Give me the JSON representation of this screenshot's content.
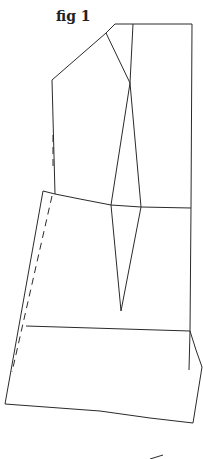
{
  "figure": {
    "caption": "fig 1",
    "type": "pattern-drafting-line-diagram",
    "stroke_color": "#2a2a2a",
    "background": "#ffffff"
  }
}
